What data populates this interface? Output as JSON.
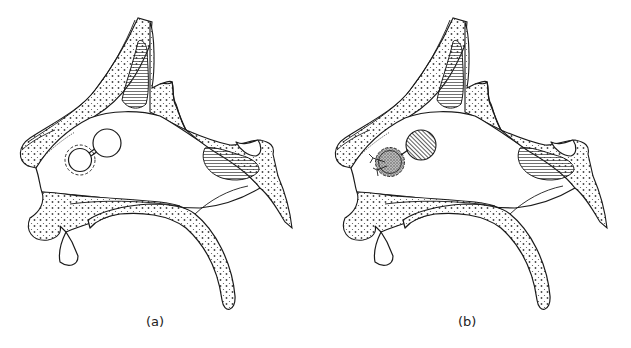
{
  "figure": {
    "panels": [
      {
        "id": "a",
        "label": "(a)",
        "description": "Sagittal section of nasal cavity showing septal perforation (round defect with dashed margin) connected to a second circle",
        "defect_state": "open"
      },
      {
        "id": "b",
        "label": "(b)",
        "description": "Same section after repair: flap (hatched) rotated and graft (stippled) sutured over the defect",
        "defect_state": "repaired"
      }
    ],
    "colors": {
      "line": "#1a1a1a",
      "background": "#ffffff"
    }
  }
}
